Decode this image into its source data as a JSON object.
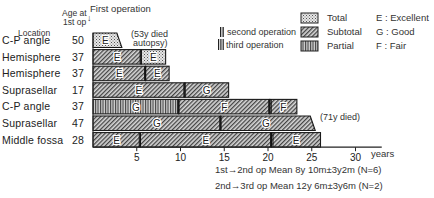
{
  "header": {
    "location_label": "Location",
    "age_label_1": "Age at",
    "age_label_2": "1st op",
    "first_operation_label": "First operation",
    "first_operation_arrow": "↓"
  },
  "legend": {
    "second_operation": "second operation",
    "third_operation": "third operation",
    "removal": [
      {
        "key": "total",
        "label": "Total"
      },
      {
        "key": "subtotal",
        "label": "Subtotal"
      },
      {
        "key": "partial",
        "label": "Partial"
      }
    ],
    "outcomes": [
      {
        "code": "E",
        "label": "E : Excellent"
      },
      {
        "code": "G",
        "label": "G : Good"
      },
      {
        "code": "F",
        "label": "F : Fair"
      }
    ]
  },
  "annotations": {
    "row1_death_1": "(53y died",
    "row1_death_2": "autopsy)",
    "row6_death": "(71y died)"
  },
  "axis": {
    "unit": "years",
    "ticks": [
      "5",
      "10",
      "15",
      "20",
      "25",
      "30"
    ]
  },
  "stats": {
    "line1": "1st→2nd op Mean 8y 10m±3y2m (N=6)",
    "line2": "2nd→3rd op Mean 12y 6m±3y6m (N=2)"
  },
  "chart_data": {
    "type": "bar",
    "subtype": "horizontal stacked timeline (Gantt-like)",
    "title": "",
    "xlabel": "years",
    "ylabel": "Location / Age at 1st op",
    "xlim": [
      0,
      33
    ],
    "xticks": [
      5,
      10,
      15,
      20,
      25,
      30
    ],
    "grid": false,
    "legend_position": "top-right",
    "legend": {
      "patterns": {
        "Total": "dotted",
        "Subtotal": "diagonal hatch",
        "Partial": "vertical lines"
      },
      "operation_markers": {
        "second operation": "double bar",
        "third operation": "triple bar"
      },
      "outcomes": {
        "E": "Excellent",
        "G": "Good",
        "F": "Fair"
      }
    },
    "rows": [
      {
        "location": "C-P angle",
        "age": 50,
        "segments": [
          {
            "start": 0,
            "end": 3.3,
            "removal": "Total",
            "outcome": "E"
          }
        ],
        "note": "(53y died autopsy)"
      },
      {
        "location": "Hemisphere",
        "age": 37,
        "segments": [
          {
            "start": 0,
            "end": 5.5,
            "removal": "Subtotal",
            "outcome": "E"
          },
          {
            "start": 5.5,
            "end": 8.3,
            "removal": "Total",
            "outcome": "E"
          }
        ]
      },
      {
        "location": "Hemisphere",
        "age": 37,
        "segments": [
          {
            "start": 0,
            "end": 6.0,
            "removal": "Subtotal",
            "outcome": "E"
          },
          {
            "start": 6.0,
            "end": 8.7,
            "removal": "Subtotal",
            "outcome": "E"
          }
        ]
      },
      {
        "location": "Suprasellar",
        "age": 17,
        "segments": [
          {
            "start": 0,
            "end": 10.5,
            "removal": "Subtotal",
            "outcome": "E"
          },
          {
            "start": 10.5,
            "end": 15.5,
            "removal": "Subtotal",
            "outcome": "G"
          }
        ]
      },
      {
        "location": "C-P angle",
        "age": 37,
        "segments": [
          {
            "start": 0,
            "end": 9.8,
            "removal": "Partial",
            "outcome": "G"
          },
          {
            "start": 9.8,
            "end": 20.2,
            "removal": "Subtotal",
            "outcome": "F"
          },
          {
            "start": 20.2,
            "end": 23.3,
            "removal": "Subtotal",
            "outcome": "F"
          }
        ]
      },
      {
        "location": "Suprasellar",
        "age": 47,
        "segments": [
          {
            "start": 0,
            "end": 14.6,
            "removal": "Subtotal",
            "outcome": "G"
          },
          {
            "start": 14.6,
            "end": 25.4,
            "removal": "Subtotal",
            "outcome": "G"
          }
        ],
        "note": "(71y died)"
      },
      {
        "location": "Middle fossa",
        "age": 28,
        "segments": [
          {
            "start": 0,
            "end": 5.4,
            "removal": "Subtotal",
            "outcome": "E"
          },
          {
            "start": 5.4,
            "end": 20.4,
            "removal": "Subtotal",
            "outcome": "E"
          },
          {
            "start": 20.4,
            "end": 26.0,
            "removal": "Subtotal",
            "outcome": "E"
          }
        ]
      }
    ],
    "annotations": [
      "1st→2nd op Mean 8y 10m±3y2m (N=6)",
      "2nd→3rd op Mean 12y 6m±3y6m (N=2)"
    ]
  }
}
